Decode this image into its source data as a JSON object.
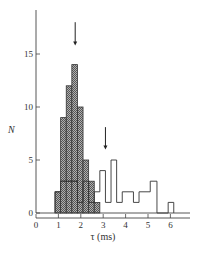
{
  "chart_data": {
    "type": "bar",
    "title": "",
    "xlabel": "τ (ms)",
    "ylabel": "N",
    "xlim": [
      0,
      6.5
    ],
    "ylim": [
      0,
      18
    ],
    "x_ticks": [
      0,
      1,
      2,
      3,
      4,
      5,
      6
    ],
    "y_ticks": [
      0,
      5,
      10,
      15
    ],
    "grid": false,
    "legend": null,
    "bin_width": 0.25,
    "series": [
      {
        "name": "hatched",
        "style": "filled-hatched",
        "bins": [
          {
            "x0": 0.85,
            "x1": 1.1,
            "value": 2
          },
          {
            "x0": 1.1,
            "x1": 1.35,
            "value": 9
          },
          {
            "x0": 1.35,
            "x1": 1.6,
            "value": 12
          },
          {
            "x0": 1.6,
            "x1": 1.85,
            "value": 14
          },
          {
            "x0": 1.85,
            "x1": 2.1,
            "value": 10
          },
          {
            "x0": 2.1,
            "x1": 2.35,
            "value": 5
          },
          {
            "x0": 2.35,
            "x1": 2.6,
            "value": 3
          },
          {
            "x0": 2.6,
            "x1": 2.85,
            "value": 1
          }
        ]
      },
      {
        "name": "open",
        "style": "outline",
        "bins": [
          {
            "x0": 0.85,
            "x1": 1.1,
            "value": 2
          },
          {
            "x0": 1.1,
            "x1": 1.85,
            "value": 3
          },
          {
            "x0": 1.85,
            "x1": 2.1,
            "value": 1
          },
          {
            "x0": 2.1,
            "x1": 2.35,
            "value": 3
          },
          {
            "x0": 2.35,
            "x1": 2.6,
            "value": 1
          },
          {
            "x0": 2.6,
            "x1": 2.85,
            "value": 2
          },
          {
            "x0": 2.85,
            "x1": 3.1,
            "value": 4
          },
          {
            "x0": 3.1,
            "x1": 3.35,
            "value": 1
          },
          {
            "x0": 3.35,
            "x1": 3.6,
            "value": 5
          },
          {
            "x0": 3.6,
            "x1": 3.85,
            "value": 1
          },
          {
            "x0": 3.85,
            "x1": 4.35,
            "value": 2
          },
          {
            "x0": 4.35,
            "x1": 4.6,
            "value": 1
          },
          {
            "x0": 4.6,
            "x1": 5.1,
            "value": 2
          },
          {
            "x0": 5.1,
            "x1": 5.4,
            "value": 3
          },
          {
            "x0": 5.4,
            "x1": 5.9,
            "value": 0
          },
          {
            "x0": 5.9,
            "x1": 6.15,
            "value": 1
          }
        ]
      }
    ],
    "annotations": [
      {
        "type": "arrow-down",
        "x": 1.75,
        "y_from": 18.0,
        "y_to": 15.8,
        "label": ""
      },
      {
        "type": "arrow-down",
        "x": 3.1,
        "y_from": 8.1,
        "y_to": 6.0,
        "label": ""
      }
    ]
  },
  "labels": {
    "x_axis": "τ (ms)",
    "y_axis": "N",
    "x_ticks": [
      "0",
      "1",
      "2",
      "3",
      "4",
      "5",
      "6"
    ],
    "y_ticks": [
      "0",
      "5",
      "10",
      "15"
    ]
  },
  "colors": {
    "axis": "#444444",
    "bar_outline": "#333333",
    "hatch_fill": "#9a9a9a",
    "hatch_dark": "#555555"
  }
}
